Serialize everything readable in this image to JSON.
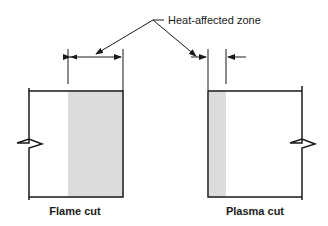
{
  "diagram": {
    "callout_label": "Heat-affected zone",
    "panels": [
      {
        "id": "flame",
        "caption": "Flame cut",
        "haz_side": "right",
        "haz_width": "wide"
      },
      {
        "id": "plasma",
        "caption": "Plasma cut",
        "haz_side": "left",
        "haz_width": "narrow"
      }
    ],
    "colors": {
      "line": "#1a1a1a",
      "haz_fill": "#dcdcdc"
    }
  }
}
